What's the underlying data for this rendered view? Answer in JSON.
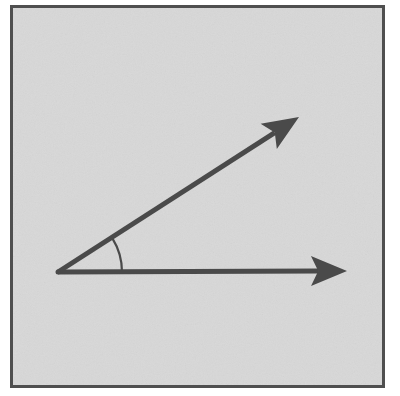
{
  "figure": {
    "canvas": {
      "width": 400,
      "height": 396
    },
    "background_color": "#ffffff",
    "panel": {
      "name": "bordered-panel",
      "x": 10,
      "y": 5,
      "width": 375,
      "height": 383,
      "fill_color": "#d8d8d8",
      "border_color": "#4f4f4f",
      "border_width": 3
    },
    "stroke_color": "#4a4a4a",
    "line_width": 5,
    "vertex": {
      "x": 58,
      "y": 272
    },
    "rays": [
      {
        "name": "horizontal-ray",
        "label": "initial side",
        "from": {
          "x": 58,
          "y": 272
        },
        "to": {
          "x": 347,
          "y": 271
        },
        "angle_degrees": 0,
        "length": 289,
        "arrowhead": "barbed"
      },
      {
        "name": "diagonal-ray",
        "label": "terminal side",
        "from": {
          "x": 58,
          "y": 272
        },
        "to": {
          "x": 299,
          "y": 117
        },
        "angle_degrees": 32,
        "length": 287,
        "arrowhead": "barbed"
      }
    ],
    "angle_arc": {
      "name": "angle-arc",
      "center": {
        "x": 58,
        "y": 272
      },
      "radius": 64,
      "start_angle_degrees": 0,
      "end_angle_degrees": 32,
      "stroke_color": "#4a4a4a",
      "stroke_width": 2.2,
      "measure_degrees": 32
    }
  }
}
